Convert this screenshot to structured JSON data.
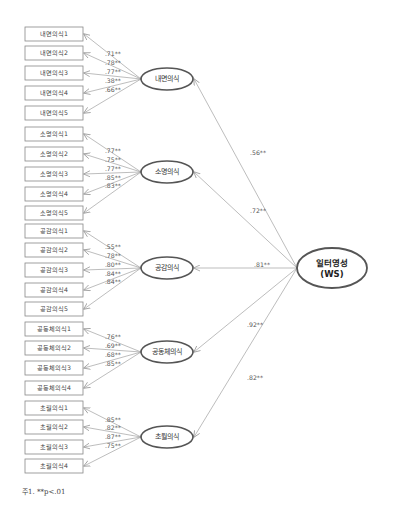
{
  "diagram": {
    "type": "second-order confirmatory factor analysis",
    "second_order_factor": {
      "label_line1": "일터영성",
      "label_line2": "(WS)",
      "cx": 332,
      "cy": 268,
      "rx": 35,
      "ry": 20
    },
    "factors": [
      {
        "name": "내면의식",
        "cx": 167,
        "cy": 79,
        "loading_from_ws": ".56**",
        "loading_label_pos": [
          250,
          153
        ],
        "indicators": [
          {
            "label": "내면의식1",
            "y": 34,
            "loading": ".71**"
          },
          {
            "label": "내면의식2",
            "y": 53,
            "loading": ".78**"
          },
          {
            "label": "내면의식3",
            "y": 73,
            "loading": ".77**"
          },
          {
            "label": "내면의식4",
            "y": 93,
            "loading": ".38**"
          },
          {
            "label": "내면의식5",
            "y": 113,
            "loading": ".66**"
          }
        ]
      },
      {
        "name": "소명의식",
        "cx": 167,
        "cy": 172,
        "loading_from_ws": ".72**",
        "loading_label_pos": [
          250,
          211
        ],
        "indicators": [
          {
            "label": "소명의식1",
            "y": 134,
            "loading": ".77**"
          },
          {
            "label": "소명의식2",
            "y": 154,
            "loading": ".75**"
          },
          {
            "label": "소명의식3",
            "y": 174,
            "loading": ".77**"
          },
          {
            "label": "소명의식4",
            "y": 194,
            "loading": ".85**"
          },
          {
            "label": "소명의식5",
            "y": 213,
            "loading": ".83**"
          }
        ]
      },
      {
        "name": "공감의식",
        "cx": 167,
        "cy": 268,
        "loading_from_ws": ".81**",
        "loading_label_pos": [
          254,
          265
        ],
        "indicators": [
          {
            "label": "공감의식1",
            "y": 231,
            "loading": ".55**"
          },
          {
            "label": "공감의식2",
            "y": 250,
            "loading": ".78**"
          },
          {
            "label": "공감의식3",
            "y": 270,
            "loading": ".80**"
          },
          {
            "label": "공감의식4",
            "y": 290,
            "loading": ".84**"
          },
          {
            "label": "공감의식5",
            "y": 309,
            "loading": ".84**"
          }
        ]
      },
      {
        "name": "공동체의식",
        "cx": 167,
        "cy": 352,
        "loading_from_ws": ".92**",
        "loading_label_pos": [
          247,
          325
        ],
        "indicators": [
          {
            "label": "공동체의식1",
            "y": 329,
            "loading": ".76**"
          },
          {
            "label": "공동체의식2",
            "y": 348,
            "loading": ".69**"
          },
          {
            "label": "공동체의식3",
            "y": 368,
            "loading": ".68**"
          },
          {
            "label": "공동체의식4",
            "y": 388,
            "loading": ".85**"
          }
        ]
      },
      {
        "name": "초월의식",
        "cx": 167,
        "cy": 437,
        "loading_from_ws": ".82**",
        "loading_label_pos": [
          247,
          378
        ],
        "indicators": [
          {
            "label": "초월의식1",
            "y": 408,
            "loading": ".85**"
          },
          {
            "label": "초월의식2",
            "y": 427,
            "loading": ".82**"
          },
          {
            "label": "초월의식3",
            "y": 447,
            "loading": ".87**"
          },
          {
            "label": "초월의식4",
            "y": 466,
            "loading": ".75**"
          }
        ]
      }
    ],
    "footnote": "주1. **p<.01"
  },
  "colors": {
    "box_border": "#888888",
    "ellipse_border": "#555555",
    "arrow": "#a0a0a0",
    "text": "#444444"
  }
}
